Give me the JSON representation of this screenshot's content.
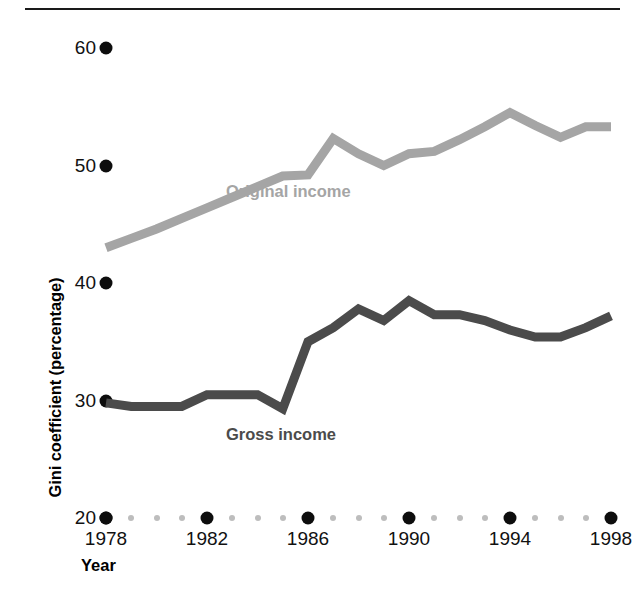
{
  "chart_data": {
    "type": "line",
    "title": "",
    "xlabel": "Year",
    "ylabel": "Gini coefficient (percentage)",
    "xlim": [
      1978,
      1998
    ],
    "ylim": [
      20,
      60
    ],
    "grid": false,
    "legend_position": "inline-labels",
    "y_ticks": [
      "60",
      "50",
      "40",
      "30",
      "20"
    ],
    "y_tick_values": [
      60,
      50,
      40,
      30,
      20
    ],
    "x_ticks": [
      "1978",
      "1982",
      "1986",
      "1990",
      "1994",
      "1998"
    ],
    "x_tick_values": [
      1978,
      1982,
      1986,
      1990,
      1994,
      1998
    ],
    "x": [
      1978,
      1979,
      1980,
      1981,
      1982,
      1983,
      1984,
      1985,
      1986,
      1987,
      1988,
      1989,
      1990,
      1991,
      1992,
      1993,
      1994,
      1995,
      1996,
      1997,
      1998
    ],
    "series": [
      {
        "name": "Original income",
        "color": "#a5a5a5",
        "values": [
          43.0,
          43.8,
          44.6,
          45.5,
          46.4,
          47.3,
          48.2,
          49.1,
          49.2,
          52.3,
          51.0,
          50.0,
          51.0,
          51.2,
          52.2,
          53.3,
          54.5,
          53.4,
          52.4,
          53.3,
          53.3
        ]
      },
      {
        "name": "Gross income",
        "color": "#4b4b4b",
        "values": [
          29.8,
          29.5,
          29.5,
          29.5,
          30.5,
          30.5,
          30.5,
          29.3,
          35.0,
          36.2,
          37.8,
          36.8,
          38.5,
          37.3,
          37.3,
          36.8,
          36.0,
          35.4,
          35.4,
          36.2,
          37.2
        ]
      }
    ]
  },
  "axes": {
    "y_title": "Gini coefficient (percentage)",
    "x_title": "Year"
  },
  "labels": {
    "original_income": "Original income",
    "gross_income": "Gross income"
  },
  "colors": {
    "original_income": "#a5a5a5",
    "gross_income": "#4b4b4b",
    "axis_dot": "#0d0d0d",
    "minor_dot": "#bdbdbd",
    "rule": "#1a1a1a"
  }
}
